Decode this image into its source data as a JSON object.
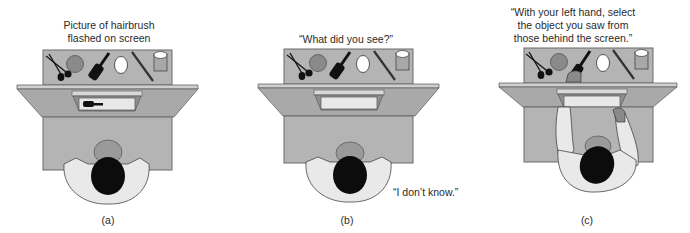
{
  "figure": {
    "panels": [
      {
        "id": "a",
        "caption_lines": [
          "Picture of hairbrush",
          "flashed on screen"
        ],
        "screen_content": "hairbrush-image",
        "label": "(a)"
      },
      {
        "id": "b",
        "caption_lines": [
          "“What did you see?”"
        ],
        "response": "“I don’t know.”",
        "label": "(b)"
      },
      {
        "id": "c",
        "caption_lines": [
          "“With your left hand, select",
          "the object you saw from",
          "those behind the screen.”"
        ],
        "label": "(c)"
      }
    ],
    "objects_on_table": [
      "spoon",
      "fork",
      "ball",
      "hairbrush",
      "egg",
      "pencil",
      "cup"
    ],
    "colors": {
      "table": "#b4b4b4",
      "table_border": "#6a6a6a",
      "screen_frame": "#c9c9c9",
      "shirt": "#e9e9e9",
      "hair": "#0c0c0c",
      "ball": "#8a8a8a"
    }
  }
}
